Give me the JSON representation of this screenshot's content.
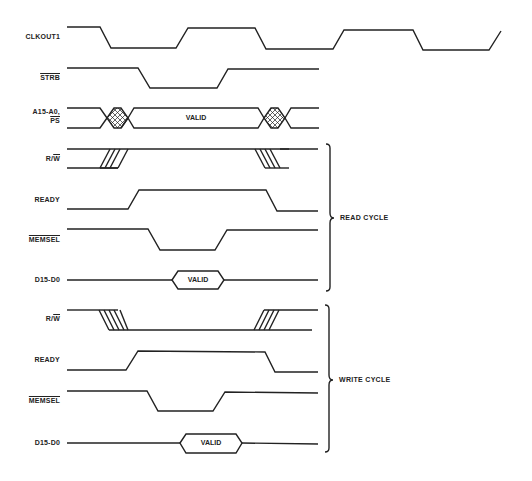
{
  "diagram": {
    "type": "timing-diagram",
    "line_color": "#222222",
    "background": "#ffffff"
  },
  "signals": {
    "clkout1": {
      "label": "CLKOUT1"
    },
    "strb": {
      "label": "STRB",
      "active_low": true
    },
    "address": {
      "label_line1": "A15-A0,",
      "label_line2": "PS",
      "label_line2_active_low": true,
      "valid_label": "VALID"
    },
    "read": {
      "rw": {
        "label_r": "R/",
        "label_w": "W"
      },
      "ready": {
        "label": "READY"
      },
      "memsel": {
        "label": "MEMSEL",
        "active_low": true
      },
      "data": {
        "label": "D15-D0",
        "valid_label": "VALID"
      }
    },
    "write": {
      "rw": {
        "label_r": "R/",
        "label_w": "W"
      },
      "ready": {
        "label": "READY"
      },
      "memsel": {
        "label": "MEMSEL",
        "active_low": true
      },
      "data": {
        "label": "D15-D0",
        "valid_label": "VALID"
      }
    }
  },
  "braces": {
    "read_cycle": "READ CYCLE",
    "write_cycle": "WRITE CYCLE"
  }
}
